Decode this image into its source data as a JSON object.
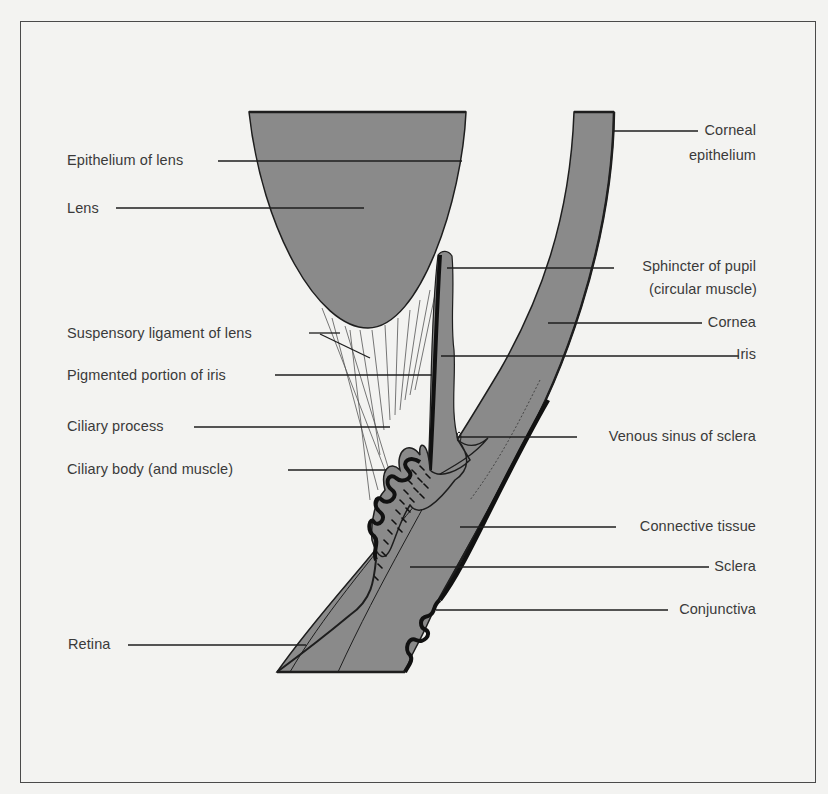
{
  "figure": {
    "colors": {
      "background": "#f3f3f1",
      "tissue_fill": "#8a8a8a",
      "ink": "#1e1e1e",
      "text": "#3a3a3a",
      "frame": "#4a4a4a"
    }
  },
  "labels": {
    "left": [
      {
        "id": "epithelium_of_lens",
        "text": "Epithelium of lens"
      },
      {
        "id": "lens",
        "text": "Lens"
      },
      {
        "id": "suspensory_ligament",
        "text": "Suspensory ligament of lens"
      },
      {
        "id": "pigmented_iris",
        "text": "Pigmented portion of iris"
      },
      {
        "id": "ciliary_process",
        "text": "Ciliary process"
      },
      {
        "id": "ciliary_body",
        "text": "Ciliary body (and muscle)"
      },
      {
        "id": "retina",
        "text": "Retina"
      }
    ],
    "right": [
      {
        "id": "corneal_epithelium_1",
        "text": "Corneal"
      },
      {
        "id": "corneal_epithelium_2",
        "text": "epithelium"
      },
      {
        "id": "sphincter_1",
        "text": "Sphincter of pupil"
      },
      {
        "id": "sphincter_2",
        "text": "(circular muscle)"
      },
      {
        "id": "cornea",
        "text": "Cornea"
      },
      {
        "id": "iris",
        "text": "Iris"
      },
      {
        "id": "venous_sinus",
        "text": "Venous sinus of sclera"
      },
      {
        "id": "connective_tissue",
        "text": "Connective tissue"
      },
      {
        "id": "sclera",
        "text": "Sclera"
      },
      {
        "id": "conjunctiva",
        "text": "Conjunctiva"
      }
    ]
  }
}
